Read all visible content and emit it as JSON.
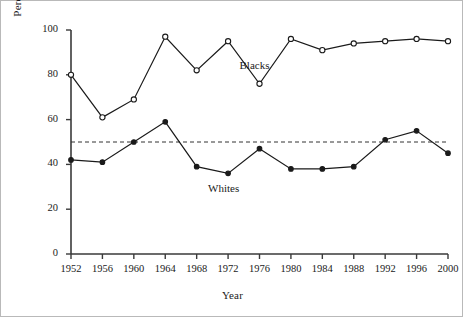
{
  "chart_data": {
    "type": "line",
    "title": "",
    "xlabel": "Year",
    "ylabel": "Percentage Voting Democrat",
    "x": [
      1952,
      1956,
      1960,
      1964,
      1968,
      1972,
      1976,
      1980,
      1984,
      1988,
      1992,
      1996,
      2000
    ],
    "xtick_labels": [
      "1952",
      "1956",
      "1960",
      "1964",
      "1968",
      "1972",
      "1976",
      "1980",
      "1984",
      "1988",
      "1992",
      "1996",
      "2000"
    ],
    "ytick_labels": [
      "0",
      "20",
      "40",
      "60",
      "80",
      "100"
    ],
    "yticks": [
      0,
      20,
      40,
      60,
      80,
      100
    ],
    "ylim": [
      0,
      100
    ],
    "grid": false,
    "legend_position": "inline-annotation",
    "reference_line": {
      "value": 50,
      "style": "dashed",
      "color": "#333333"
    },
    "series": [
      {
        "name": "Blacks",
        "marker": "open-circle",
        "color": "#1a1a1a",
        "label_x": 1976,
        "label_y": 84,
        "values": [
          80,
          61,
          69,
          97,
          82,
          95,
          76,
          96,
          91,
          94,
          95,
          96,
          95
        ]
      },
      {
        "name": "Whites",
        "marker": "filled-circle",
        "color": "#1a1a1a",
        "label_x": 1972,
        "label_y": 29,
        "values": [
          42,
          41,
          50,
          59,
          39,
          36,
          47,
          38,
          38,
          39,
          51,
          55,
          45
        ]
      }
    ]
  }
}
